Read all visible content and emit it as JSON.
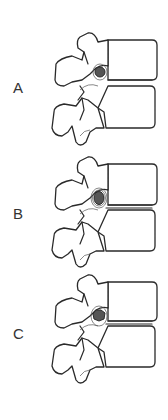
{
  "figure": {
    "panels": [
      {
        "id": "A",
        "label": "A",
        "lesion": "round-large"
      },
      {
        "id": "B",
        "label": "B",
        "lesion": "round-ringed"
      },
      {
        "id": "C",
        "label": "C",
        "lesion": "irregular-small"
      }
    ],
    "colors": {
      "outline": "#2a2a2a",
      "lesion_fill": "#555555",
      "background": "#ffffff"
    }
  }
}
